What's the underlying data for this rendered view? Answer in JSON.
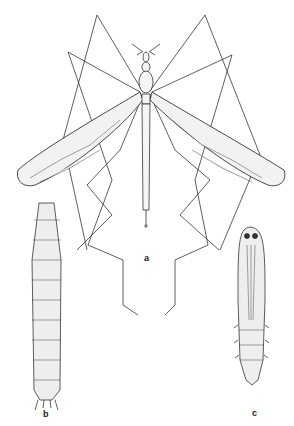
{
  "figure": {
    "labels": {
      "adult": "a",
      "larva": "b",
      "pupa": "c"
    },
    "colors": {
      "ink": "#1a1a1a",
      "background": "#ffffff"
    }
  }
}
